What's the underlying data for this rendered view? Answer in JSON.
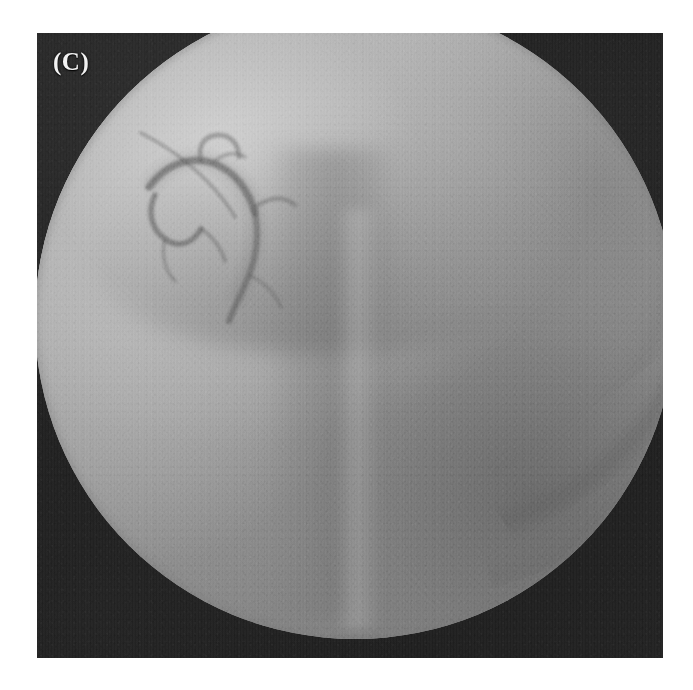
{
  "figure": {
    "panel_label": "(C)",
    "modality": "fluoroscopic radiograph",
    "caption": "",
    "background_color": "#ffffff"
  },
  "frame": {
    "x": 37,
    "y": 33,
    "width": 626,
    "height": 625,
    "border_color": "#1d1d1d",
    "collimation_color": "#1f1f1f"
  },
  "field_of_view": {
    "shape": "circle",
    "center_x": 318,
    "center_y": 286,
    "radius": 320,
    "clipped_edges": [
      "top",
      "bottom"
    ],
    "bright_color": "#c6c6c6",
    "mid_color": "#9b9b9b",
    "dark_color": "#7f7f7f"
  },
  "anatomy": [
    {
      "name": "rib-band-outer",
      "label": "Right costal arch shadow",
      "tone": "dark"
    },
    {
      "name": "rib-band-inner",
      "label": "Inner rib arc",
      "tone": "dark"
    },
    {
      "name": "rib-band-lower",
      "label": "Lower rib arc",
      "tone": "dark"
    },
    {
      "name": "diaphragm-shadow",
      "label": "Diaphragmatic / hepatic dome shadow",
      "tone": "dark"
    },
    {
      "name": "spine-column",
      "label": "Vertebral column",
      "tone": "dark"
    },
    {
      "name": "paraspinal-stripe",
      "label": "Paraspinal bright stripe",
      "tone": "bright"
    },
    {
      "name": "pelvic-shadow",
      "label": "Lower soft-tissue shadow",
      "tone": "dark"
    },
    {
      "name": "contrast-tree",
      "label": "Contrast-filled ductal tree",
      "tone": "dark"
    },
    {
      "name": "catheter-line",
      "label": "Catheter",
      "tone": "dark"
    }
  ],
  "texture": {
    "grain": "film-grain",
    "grain_opacity": 0.3,
    "scan_lines": true
  }
}
